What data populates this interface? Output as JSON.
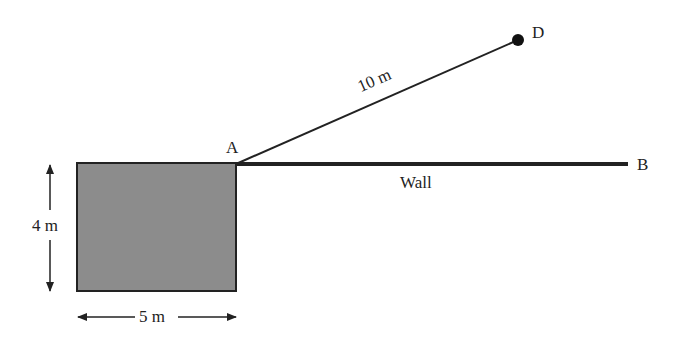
{
  "diagram": {
    "points": {
      "A": "A",
      "B": "B",
      "D": "D"
    },
    "labels": {
      "rope_length": "10 m",
      "wall": "Wall",
      "height": "4 m",
      "width": "5 m"
    },
    "colors": {
      "square_fill": "#8c8c8c",
      "line": "#222222"
    }
  }
}
